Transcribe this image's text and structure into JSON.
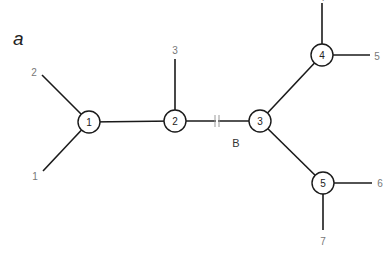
{
  "panel_label": "a",
  "branch_label": "B",
  "colors": {
    "edge": "#1a1a1a",
    "leaf_label": "#777777",
    "background": "#ffffff"
  },
  "internal_nodes": [
    {
      "id": "1",
      "label": "1",
      "x": 89,
      "y": 122
    },
    {
      "id": "2",
      "label": "2",
      "x": 175,
      "y": 121
    },
    {
      "id": "3",
      "label": "3",
      "x": 260,
      "y": 121
    },
    {
      "id": "4",
      "label": "4",
      "x": 322,
      "y": 55
    },
    {
      "id": "5",
      "label": "5",
      "x": 323,
      "y": 183
    }
  ],
  "leaves": [
    {
      "label": "1",
      "parent": "1",
      "x": 43,
      "y": 171,
      "label_x": 35,
      "label_y": 176
    },
    {
      "label": "2",
      "parent": "1",
      "x": 42,
      "y": 75,
      "label_x": 34,
      "label_y": 72
    },
    {
      "label": "3",
      "parent": "2",
      "x": 175,
      "y": 59,
      "label_x": 175,
      "label_y": 50
    },
    {
      "label": "4",
      "parent": "4",
      "x": 322,
      "y": 3,
      "label_x": 322,
      "label_y": -3
    },
    {
      "label": "5",
      "parent": "4",
      "x": 370,
      "y": 55,
      "label_x": 377,
      "label_y": 56
    },
    {
      "label": "6",
      "parent": "5",
      "x": 372,
      "y": 183,
      "label_x": 380,
      "label_y": 183
    },
    {
      "label": "7",
      "parent": "5",
      "x": 323,
      "y": 230,
      "label_x": 323,
      "label_y": 241
    }
  ],
  "internal_edges": [
    {
      "from": "1",
      "to": "2"
    },
    {
      "from": "2",
      "to": "3",
      "broken": true,
      "label": "B"
    },
    {
      "from": "3",
      "to": "4"
    },
    {
      "from": "3",
      "to": "5"
    }
  ]
}
